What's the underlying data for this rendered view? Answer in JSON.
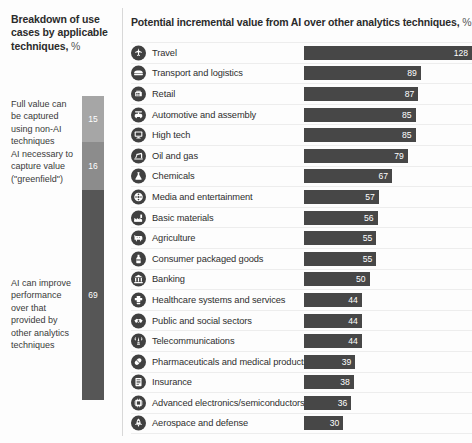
{
  "left": {
    "title": "Breakdown of use cases by applicable techniques,",
    "title_unit": "%",
    "stack_bar": {
      "segments": [
        {
          "label": "Full value can be captured using non-AI techniques",
          "value": 15,
          "color": "#a6a6a6"
        },
        {
          "label": "AI necessary to capture value (\"greenfield\")",
          "value": 16,
          "color": "#8c8c8c"
        },
        {
          "label": "AI can improve performance over that provided by other analytics techniques",
          "value": 69,
          "color": "#565656"
        }
      ]
    }
  },
  "right": {
    "title": "Potential incremental value from AI over other analytics techniques,",
    "title_unit": "%"
  },
  "chart_data": {
    "type": "bar",
    "title": "Potential incremental value from AI over other analytics techniques, %",
    "xlabel": "",
    "ylabel": "",
    "orientation": "horizontal",
    "xlim": [
      0,
      128
    ],
    "grid": false,
    "legend": "none",
    "categories": [
      "Travel",
      "Transport and logistics",
      "Retail",
      "Automotive and assembly",
      "High tech",
      "Oil and gas",
      "Chemicals",
      "Media and entertainment",
      "Basic materials",
      "Agriculture",
      "Consumer packaged goods",
      "Banking",
      "Healthcare systems and services",
      "Public and social sectors",
      "Telecommunications",
      "Pharmaceuticals and medical products",
      "Insurance",
      "Advanced electronics/semiconductors",
      "Aerospace and defense"
    ],
    "values": [
      128,
      89,
      87,
      85,
      85,
      79,
      67,
      57,
      56,
      55,
      55,
      50,
      44,
      44,
      44,
      39,
      38,
      36,
      30
    ],
    "icons": [
      "airplane-icon",
      "truck-icon",
      "shopping-cart-icon",
      "car-icon",
      "monitor-icon",
      "oil-pump-icon",
      "flask-icon",
      "film-reel-icon",
      "factory-icon",
      "cow-icon",
      "bottle-icon",
      "bank-icon",
      "health-cross-icon",
      "handshake-icon",
      "antenna-tower-icon",
      "pill-icon",
      "document-icon",
      "microchip-icon",
      "rocket-icon"
    ],
    "secondary_chart": {
      "type": "stacked-bar",
      "title": "Breakdown of use cases by applicable techniques, %",
      "categories": [
        "Full value can be captured using non-AI techniques",
        "AI necessary to capture value (\"greenfield\")",
        "AI can improve performance over that provided by other analytics techniques"
      ],
      "values": [
        15,
        16,
        69
      ]
    }
  }
}
